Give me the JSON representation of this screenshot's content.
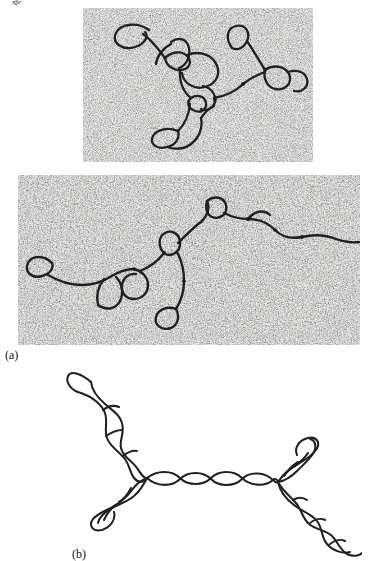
{
  "figure": {
    "kind": "scientific-figure",
    "background_color": "#ffffff",
    "ink_color": "#231f20",
    "panels": [
      {
        "id": "a",
        "label": "(a)",
        "label_x": 5,
        "label_y": 349,
        "description": "Electron micrographs of chi-form DNA molecules",
        "plates": [
          {
            "id": "micrograph-top",
            "x": 83,
            "y": 8,
            "width": 230,
            "height": 154,
            "base_color": "#f0efed",
            "grain_color": "#1d1d1d"
          },
          {
            "id": "micrograph-bottom",
            "x": 18,
            "y": 175,
            "width": 342,
            "height": 170,
            "base_color": "#f1f0ee",
            "grain_color": "#1d1d1d"
          }
        ]
      },
      {
        "id": "b",
        "label": "(b)",
        "label_x": 72,
        "label_y": 548,
        "description": "Line drawing of a chi-form (Holliday junction) DNA structure with four double-helical arms",
        "diagram": {
          "x": 62,
          "y": 360,
          "width": 300,
          "height": 200,
          "stroke_color": "#231f20",
          "stroke_width": 2.05,
          "arm_count": 4,
          "junction_left": {
            "x": 147,
            "y": 478
          },
          "junction_right": {
            "x": 278,
            "y": 482
          },
          "arms": [
            {
              "name": "upper-left",
              "end_x": 80,
              "end_y": 375
            },
            {
              "name": "lower-left",
              "end_x": 95,
              "end_y": 525
            },
            {
              "name": "upper-right",
              "end_x": 318,
              "end_y": 440
            },
            {
              "name": "lower-right",
              "end_x": 358,
              "end_y": 556
            }
          ]
        }
      }
    ]
  }
}
